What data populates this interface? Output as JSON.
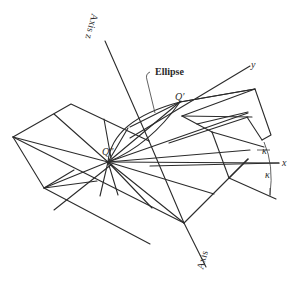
{
  "figure": {
    "labels": {
      "axis_z": "Axis z",
      "axis_bottom": "Axis",
      "ellipse": "Ellipse",
      "y": "y",
      "x": "x",
      "q_prime": "Q′",
      "q_double_prime": "Q″",
      "kappa_upper": "κ",
      "kappa_lower": "κ"
    },
    "colors": {
      "line": "#2b2b2b",
      "background": "#ffffff"
    }
  }
}
